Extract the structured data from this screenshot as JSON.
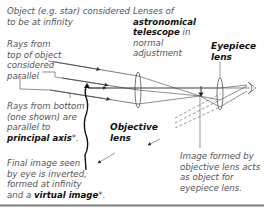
{
  "diagram": {
    "labels": {
      "object": "Object (e.g. star) considered to be at infinity",
      "object_line1": "Object (e.g. star) considered",
      "object_line2": "to be at infinity",
      "lenses_line1": "Lenses of",
      "lenses_line2": "astronomical",
      "lenses_line3_bold": "telescope",
      "lenses_line3_rest": " in",
      "lenses_line4": "normal",
      "lenses_line5": "adjustment",
      "eyepiece_line1": "Eyepiece",
      "eyepiece_line2": "lens",
      "rays_top_line1": "Rays from",
      "rays_top_line2": "top of object",
      "rays_top_line3": "considered",
      "rays_top_line4": "parallel",
      "rays_bottom_line1": "Rays from bottom",
      "rays_bottom_line2": "(one shown) are",
      "rays_bottom_line3": "parallel to",
      "rays_bottom_bold": "principal axis",
      "rays_bottom_star": "*.",
      "objective_line1": "Objective",
      "objective_line2": "lens",
      "final_line1": "Final image seen",
      "final_line2": "by eye is inverted,",
      "final_line3": "formed at infinity",
      "final_line4_pre": "and a ",
      "final_line4_bold": "virtual image",
      "final_line4_star": "*.",
      "image_line1": "Image formed by",
      "image_line2": "objective lens acts",
      "image_line3": "as object for",
      "image_line4": "eyepiece lens."
    },
    "components": [
      "objective-lens",
      "eyepiece-lens",
      "principal-axis",
      "eye",
      "intermediate-image",
      "final-image-rays"
    ]
  }
}
